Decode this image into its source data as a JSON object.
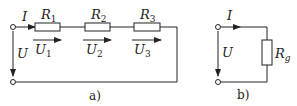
{
  "diagram": {
    "type": "circuit",
    "panels": [
      {
        "caption": "a)",
        "current_label": "I",
        "voltage_label": "U",
        "resistors": [
          {
            "name": "R",
            "sub": "1",
            "voltage": "U",
            "vsub": "1"
          },
          {
            "name": "R",
            "sub": "2",
            "voltage": "U",
            "vsub": "2"
          },
          {
            "name": "R",
            "sub": "3",
            "voltage": "U",
            "vsub": "3"
          }
        ]
      },
      {
        "caption": "b)",
        "current_label": "I",
        "voltage_label": "U",
        "resistor": {
          "name": "R",
          "sub": "g"
        }
      }
    ],
    "colors": {
      "line": "#222222",
      "background": "#ffffff"
    }
  }
}
